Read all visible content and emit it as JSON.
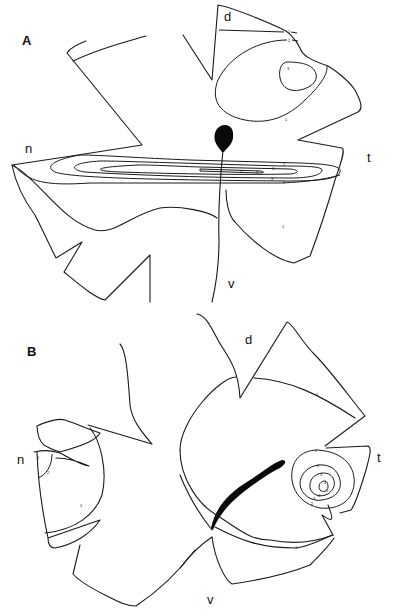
{
  "figure": {
    "panels": [
      {
        "label": "A",
        "orientation": {
          "dorsal": "d",
          "nasal": "n",
          "temporal": "t",
          "ventral": "v"
        },
        "contour_labels": [
          "1",
          "2",
          "3",
          "1",
          "2",
          "3",
          "4",
          "5",
          "3",
          "2",
          "1"
        ]
      },
      {
        "label": "B",
        "orientation": {
          "dorsal": "d",
          "nasal": "n",
          "temporal": "t",
          "ventral": "v"
        },
        "contour_labels": [
          "1",
          "2",
          "1",
          "1",
          "1",
          "2",
          "3",
          "4",
          "5",
          "4",
          "3",
          "2",
          "1"
        ]
      }
    ],
    "colors": {
      "line": "#1a1a1a",
      "background": "#ffffff",
      "optic_disc": "#0a0a0a"
    }
  }
}
